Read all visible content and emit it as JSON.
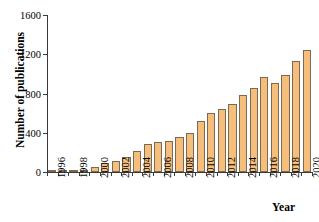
{
  "chart_data": {
    "type": "bar",
    "title": "",
    "xlabel": "Year",
    "ylabel": "Number of publications",
    "categories": [
      "1996",
      "1997",
      "1998",
      "1999",
      "2000",
      "2001",
      "2002",
      "2003",
      "2004",
      "2005",
      "2006",
      "2007",
      "2008",
      "2009",
      "2010",
      "2011",
      "2012",
      "2013",
      "2014",
      "2015",
      "2016",
      "2017",
      "2018",
      "2019",
      "2020"
    ],
    "values": [
      2,
      5,
      15,
      20,
      50,
      95,
      110,
      155,
      210,
      285,
      310,
      320,
      355,
      400,
      520,
      605,
      645,
      690,
      785,
      860,
      965,
      910,
      990,
      1130,
      1243
    ],
    "ylim": [
      0,
      1600
    ],
    "yticks": [
      0,
      400,
      800,
      1200,
      1600
    ],
    "ytick_labels": [
      "0",
      "400",
      "800",
      "1200",
      "1600"
    ],
    "xtick_labels": [
      "1996",
      "1998",
      "2000",
      "2002",
      "2004",
      "2006",
      "2008",
      "2010",
      "2012",
      "2014",
      "2016",
      "2018",
      "2020"
    ],
    "grid": false,
    "legend": false,
    "bar_color": "#f5be7a",
    "bar_edge_color": "#7a6a55",
    "axis_color": "#3a3a3a"
  }
}
